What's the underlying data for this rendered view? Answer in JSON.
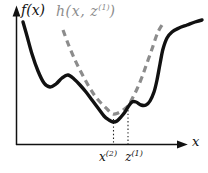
{
  "labels": {
    "f_label": "f(x)",
    "h_label": {
      "pre": "h(x, z",
      "sup": "(1)",
      "post": ")"
    },
    "x_axis_label": "x",
    "x2_label": {
      "base": "x",
      "sup": "(2)"
    },
    "z1_label": {
      "base": "z",
      "sup": "(1)"
    }
  },
  "colors": {
    "curve_f": "#111111",
    "curve_h": "#8c8c8c",
    "axis": "#111111",
    "dotted": "#222222",
    "background": "#ffffff"
  },
  "chart_data": {
    "type": "line",
    "title": "",
    "xlabel": "x",
    "ylabel": "f(x)",
    "grid": false,
    "legend": "none",
    "coord_space": "image pixels, y increases downward; axes are qualitative (no numeric ticks)",
    "series": [
      {
        "name": "f(x)",
        "style": "solid",
        "color": "#111111",
        "points": [
          [
            23,
            22
          ],
          [
            27,
            36
          ],
          [
            32,
            54
          ],
          [
            38,
            71
          ],
          [
            44,
            83
          ],
          [
            50,
            87
          ],
          [
            56,
            84
          ],
          [
            62,
            78
          ],
          [
            68,
            75
          ],
          [
            74,
            79
          ],
          [
            80,
            85
          ],
          [
            86,
            92
          ],
          [
            92,
            100
          ],
          [
            98,
            108
          ],
          [
            104,
            116
          ],
          [
            109,
            120
          ],
          [
            113,
            122
          ],
          [
            117,
            121
          ],
          [
            121,
            117
          ],
          [
            125,
            112
          ],
          [
            128,
            107
          ],
          [
            132,
            102
          ],
          [
            136,
            102
          ],
          [
            141,
            105
          ],
          [
            146,
            105
          ],
          [
            150,
            101
          ],
          [
            154,
            92
          ],
          [
            157,
            80
          ],
          [
            160,
            64
          ],
          [
            163,
            49
          ],
          [
            167,
            38
          ],
          [
            172,
            32
          ],
          [
            179,
            28
          ],
          [
            187,
            25
          ],
          [
            195,
            22
          ],
          [
            202,
            20
          ]
        ]
      },
      {
        "name": "h(x, z^(1))",
        "style": "dashed",
        "color": "#8c8c8c",
        "points": [
          [
            63,
            30
          ],
          [
            69,
            46
          ],
          [
            75,
            60
          ],
          [
            81,
            72
          ],
          [
            88,
            85
          ],
          [
            95,
            96
          ],
          [
            102,
            104
          ],
          [
            108,
            110
          ],
          [
            113,
            114
          ],
          [
            118,
            113
          ],
          [
            123,
            110
          ],
          [
            128,
            106
          ],
          [
            132,
            99
          ],
          [
            137,
            89
          ],
          [
            142,
            77
          ],
          [
            147,
            63
          ],
          [
            152,
            49
          ],
          [
            156,
            37
          ],
          [
            159,
            30
          ],
          [
            162,
            25
          ]
        ]
      }
    ],
    "annotations": [
      {
        "label": "x^(2)",
        "type": "dotted-vertical-line",
        "x": 113.5,
        "y1": 119,
        "y2": 144
      },
      {
        "label": "z^(1)",
        "type": "dotted-vertical-line",
        "x": 128,
        "y1": 110,
        "y2": 144
      }
    ]
  }
}
